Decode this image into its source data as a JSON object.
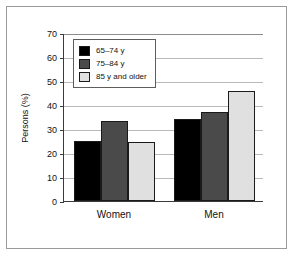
{
  "figure": {
    "frame_border_color": "#9a9a9a",
    "background": "#ffffff"
  },
  "chart_data": {
    "type": "bar",
    "title": "",
    "subtitle": "",
    "xlabel": "",
    "ylabel": "Persons (%)",
    "ylim": [
      0,
      70
    ],
    "yticks": [
      0,
      10,
      20,
      30,
      40,
      50,
      60,
      70
    ],
    "ytick_labels": [
      "0",
      "10",
      "20",
      "30",
      "40",
      "50",
      "60",
      "70"
    ],
    "grid": "horizontal",
    "legend_position": "upper-left-inside",
    "categories": [
      "Women",
      "Men"
    ],
    "series": [
      {
        "name": "65–74 y",
        "color": "#000000",
        "values": [
          25,
          34
        ]
      },
      {
        "name": "75–84 y",
        "color": "#4a4a4a",
        "values": [
          33.5,
          37
        ]
      },
      {
        "name": "85 y and older",
        "color": "#e0e0e0",
        "values": [
          24.5,
          46
        ]
      }
    ]
  },
  "legend": {
    "items": [
      {
        "label": "65–74 y",
        "color": "#000000"
      },
      {
        "label": "75–84 y",
        "color": "#4a4a4a"
      },
      {
        "label": "85 y and older",
        "color": "#e0e0e0"
      }
    ]
  }
}
